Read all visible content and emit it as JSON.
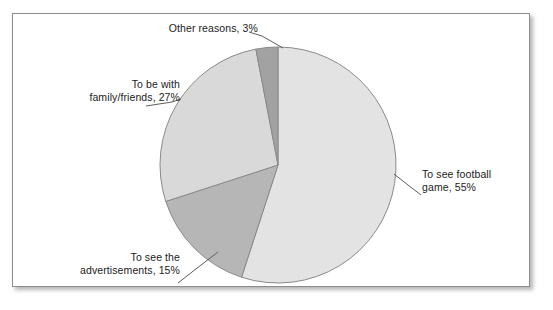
{
  "figure": {
    "frame_border_color": "#8d8d8d",
    "background": "#ffffff"
  },
  "chart_data": {
    "type": "pie",
    "title": "",
    "categories": [
      "To see football game",
      "To see the advertisements",
      "To be with family/friends",
      "Other reasons"
    ],
    "values": [
      55,
      15,
      27,
      3
    ],
    "units": "%",
    "start_angle_deg": 0,
    "direction": "clockwise",
    "legend_position": "none",
    "labels_outside": true,
    "slice_colors": [
      "#e3e3e3",
      "#b6b6b6",
      "#d9d9d9",
      "#a2a2a2"
    ],
    "slice_outline_color": "#8a8a8a",
    "slices": [
      {
        "name": "To see football game",
        "value": 55,
        "label_line_1": "To see football",
        "label_line_2": "game, 55%",
        "color": "#e3e3e3"
      },
      {
        "name": "To see the advertisements",
        "value": 15,
        "label_line_1": "To see the",
        "label_line_2": "advertisements, 15%",
        "color": "#b6b6b6"
      },
      {
        "name": "To be with family/friends",
        "value": 27,
        "label_line_1": "To be with",
        "label_line_2": "family/friends, 27%",
        "color": "#d9d9d9"
      },
      {
        "name": "Other reasons",
        "value": 3,
        "label_line_1": "Other reasons, 3%",
        "label_line_2": "",
        "color": "#a2a2a2"
      }
    ]
  }
}
